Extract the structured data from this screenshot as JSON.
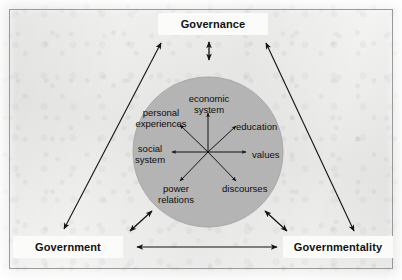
{
  "figure": {
    "background_color": "#ececeb",
    "border_color": "#9a9a9a",
    "circle_color": "#b4b4b4",
    "ink_color": "#111111"
  },
  "corner_boxes": [
    {
      "id": "governance",
      "label": "Governance",
      "position": "top-center"
    },
    {
      "id": "government",
      "label": "Government",
      "position": "bottom-left"
    },
    {
      "id": "governmentality",
      "label": "Governmentality",
      "position": "bottom-right"
    }
  ],
  "circle": {
    "center_x": 208,
    "center_y": 152,
    "radius": 75,
    "fill": "#b4b4b4"
  },
  "radial_nodes": [
    {
      "id": "economic-system",
      "label": "economic\nsystem",
      "line1": "economic",
      "line2": "system",
      "direction": "up"
    },
    {
      "id": "education",
      "label": "education",
      "line1": "education",
      "line2": "",
      "direction": "upper-right"
    },
    {
      "id": "values",
      "label": "values",
      "line1": "values",
      "line2": "",
      "direction": "right"
    },
    {
      "id": "discourses",
      "label": "discourses",
      "line1": "discourses",
      "line2": "",
      "direction": "lower-right"
    },
    {
      "id": "power-relations",
      "label": "power\nrelations",
      "line1": "power",
      "line2": "relations",
      "direction": "lower-left"
    },
    {
      "id": "social-system",
      "label": "social\nsystem",
      "line1": "social",
      "line2": "system",
      "direction": "left"
    },
    {
      "id": "personal-experiences",
      "label": "personal\nexperiences",
      "line1": "personal",
      "line2": "experiences",
      "direction": "upper-left"
    }
  ],
  "connectors": [
    {
      "id": "government-to-governance",
      "type": "double-arrow",
      "from": "Government",
      "to": "Governance"
    },
    {
      "id": "governance-to-governmentality",
      "type": "double-arrow",
      "from": "Governance",
      "to": "Governmentality"
    },
    {
      "id": "government-to-governmentality",
      "type": "double-arrow",
      "from": "Government",
      "to": "Governmentality"
    },
    {
      "id": "governance-to-circle",
      "type": "double-arrow",
      "from": "Governance",
      "to": "circle"
    },
    {
      "id": "government-to-circle",
      "type": "double-arrow",
      "from": "Government",
      "to": "circle"
    },
    {
      "id": "governmentality-to-circle",
      "type": "double-arrow",
      "from": "Governmentality",
      "to": "circle"
    }
  ]
}
